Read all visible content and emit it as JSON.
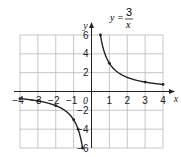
{
  "chart_data": {
    "type": "line",
    "equation": {
      "lhs": "y =",
      "numerator": "3",
      "denominator": "x"
    },
    "xlabel": "x",
    "ylabel": "y",
    "origin_label": "0",
    "xlim": [
      -4,
      4
    ],
    "ylim": [
      -6,
      6
    ],
    "grid": true,
    "x_ticks": [
      "-4",
      "-3",
      "-2",
      "-1",
      "1",
      "2",
      "3",
      "4"
    ],
    "y_ticks": [
      "6",
      "4",
      "2",
      "-2",
      "-4",
      "-6"
    ],
    "series": [
      {
        "name": "positive branch",
        "points": [
          [
            0.5,
            6
          ],
          [
            1,
            3
          ],
          [
            1.5,
            2
          ],
          [
            2,
            1.5
          ],
          [
            3,
            1
          ],
          [
            4,
            0.75
          ]
        ]
      },
      {
        "name": "negative branch",
        "points": [
          [
            -4,
            -0.75
          ],
          [
            -3,
            -1
          ],
          [
            -2,
            -1.5
          ],
          [
            -1,
            -3
          ],
          [
            -0.75,
            -4
          ],
          [
            -0.5,
            -6
          ]
        ]
      }
    ],
    "marked_points": [
      [
        0.5,
        6
      ],
      [
        1,
        3
      ],
      [
        3,
        1
      ],
      [
        4,
        0.75
      ],
      [
        -4,
        -0.75
      ],
      [
        -3,
        -1
      ],
      [
        -2,
        -1.5
      ],
      [
        -1,
        -3
      ],
      [
        -0.75,
        -4
      ],
      [
        -0.5,
        -6
      ]
    ]
  }
}
